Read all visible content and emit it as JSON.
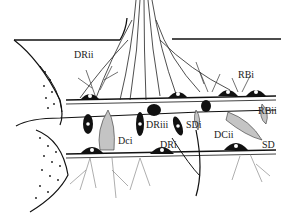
{
  "figure": {
    "type": "anatomical line illustration",
    "labels": [
      {
        "id": "DRii",
        "text": "DRii",
        "x": 74,
        "y": 56
      },
      {
        "id": "RBi",
        "text": "RBi",
        "x": 241,
        "y": 68
      },
      {
        "id": "RBii",
        "text": "RBii",
        "x": 259,
        "y": 102
      },
      {
        "id": "DRiii",
        "text": "DRiii",
        "x": 146,
        "y": 118
      },
      {
        "id": "SDi",
        "text": "SDi",
        "x": 186,
        "y": 116
      },
      {
        "id": "DCii",
        "text": "DCii",
        "x": 214,
        "y": 130
      },
      {
        "id": "Dci",
        "text": "Dci",
        "x": 121,
        "y": 136
      },
      {
        "id": "DRi",
        "text": "DRi",
        "x": 160,
        "y": 138
      },
      {
        "id": "SD",
        "text": "SD",
        "x": 262,
        "y": 138
      }
    ],
    "colors": {
      "ink": "#111111",
      "shade": "#bdbdbd",
      "paper": "#ffffff"
    }
  }
}
